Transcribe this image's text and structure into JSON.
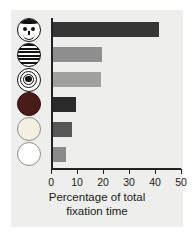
{
  "figure": {
    "background": "#eeeeec",
    "axis_color": "#222222"
  },
  "stimuli": [
    {
      "name": "schematic-face",
      "label": "Schematic face"
    },
    {
      "name": "stripes",
      "label": "Horizontal stripes"
    },
    {
      "name": "bulls-eye",
      "label": "Concentric circles (bull's eye)"
    },
    {
      "name": "red-disc",
      "label": "Plain red disc"
    },
    {
      "name": "yellow-disc",
      "label": "Plain yellow disc"
    },
    {
      "name": "white-disc",
      "label": "Plain white disc"
    }
  ],
  "axis": {
    "ticks": [
      "0",
      "10",
      "20",
      "30",
      "40",
      "50"
    ],
    "title_line1": "Percentage of total",
    "title_line2": "fixation time"
  },
  "chart_data": {
    "type": "bar",
    "orientation": "horizontal",
    "title": "",
    "xlabel": "Percentage of total fixation time",
    "ylabel": "",
    "xlim": [
      0,
      50
    ],
    "xticks": [
      0,
      10,
      20,
      30,
      40,
      50
    ],
    "grid": false,
    "legend": false,
    "categories": [
      "Schematic face",
      "Horizontal stripes",
      "Bull's eye",
      "Red disc",
      "Yellow disc",
      "White disc"
    ],
    "values": [
      41,
      19,
      18.5,
      9,
      7.5,
      5
    ],
    "colors": [
      "#363636",
      "#8e8e8e",
      "#a0a0a0",
      "#2a2a2a",
      "#585858",
      "#8a8a8a"
    ]
  }
}
